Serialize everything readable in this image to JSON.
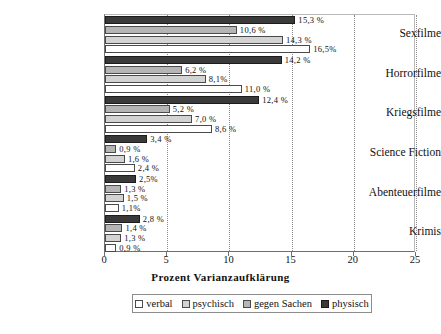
{
  "chart_data": {
    "type": "bar",
    "orientation": "horizontal",
    "title": "",
    "xlabel": "Prozent Varianzaufklärung",
    "ylabel": "",
    "xlim": [
      0,
      25
    ],
    "xticks": [
      0,
      5,
      10,
      15,
      20,
      25
    ],
    "xticklabels": [
      "0",
      "5",
      "10",
      "15",
      "20",
      "25"
    ],
    "grid": true,
    "legend_position": "bottom",
    "value_suffix": "%",
    "decimal_separator": ",",
    "categories": [
      "Sexfilme",
      "Horrorfilme",
      "Kriegsfilme",
      "Science Fiction",
      "Abenteuerfilme",
      "Krimis"
    ],
    "series": [
      {
        "name": "verbal",
        "color": "#ffffff",
        "values": [
          16.5,
          11.0,
          8.6,
          2.4,
          1.1,
          0.9
        ],
        "labels": [
          "16,5%",
          "11,0 %",
          "8,6 %",
          "2,4 %",
          "1,1%",
          "0,9 %"
        ]
      },
      {
        "name": "psychisch",
        "color": "#d3d3d3",
        "values": [
          14.3,
          8.1,
          7.0,
          1.6,
          1.5,
          1.3
        ],
        "labels": [
          "14,3 %",
          "8,1%",
          "7,0 %",
          "1,6 %",
          "1,5 %",
          "1,3 %"
        ]
      },
      {
        "name": "gegen Sachen",
        "color": "#b5b5b5",
        "values": [
          10.6,
          6.2,
          5.2,
          0.9,
          1.3,
          1.4
        ],
        "labels": [
          "10,6 %",
          "6,2 %",
          "5,2 %",
          "0,9 %",
          "1,3 %",
          "1,4 %"
        ]
      },
      {
        "name": "physisch",
        "color": "#3a3a3a",
        "values": [
          15.3,
          14.2,
          12.4,
          3.4,
          2.5,
          2.8
        ],
        "labels": [
          "15,3 %",
          "14,2 %",
          "12,4 %",
          "3,4 %",
          "2,5%",
          "2,8 %"
        ]
      }
    ]
  },
  "legend": {
    "items": [
      {
        "label": "verbal",
        "key": "verbal"
      },
      {
        "label": "psychisch",
        "key": "psychisch"
      },
      {
        "label": "gegen Sachen",
        "key": "sachen"
      },
      {
        "label": "physisch",
        "key": "physisch"
      }
    ]
  }
}
